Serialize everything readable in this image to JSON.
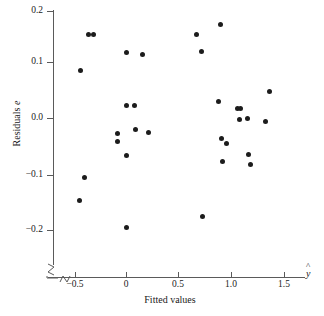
{
  "figure": {
    "background": "#ffffff",
    "point_color": "#1c1c1c",
    "axis_color": "#5a5a5a"
  },
  "axes": {
    "x": {
      "title": "Fitted values",
      "end_label": "y",
      "end_label_accent": "^",
      "ticks": [
        -0.5,
        0,
        0.5,
        1.0,
        1.5
      ],
      "tick_labels": [
        "−0.5",
        "0",
        "0.5",
        "1.0",
        "1.5"
      ],
      "has_break": true,
      "range": [
        -0.72,
        1.78
      ]
    },
    "y": {
      "title_text": "Residuals",
      "title_symbol": "e",
      "ticks": [
        0.2,
        0.1,
        0.0,
        -0.1,
        -0.2
      ],
      "tick_labels": [
        "0.2",
        "0.1",
        "0.0",
        "−0.1",
        "−0.2"
      ],
      "has_break": true,
      "range": [
        -0.26,
        0.2
      ]
    }
  },
  "chart_data": {
    "type": "scatter",
    "title": "",
    "xlabel": "Fitted values",
    "ylabel": "Residuals e",
    "xlim": [
      -0.72,
      1.78
    ],
    "ylim": [
      -0.26,
      0.2
    ],
    "grid": false,
    "legend": null,
    "series": [
      {
        "name": "residuals",
        "marker": "filled-circle",
        "color": "#1c1c1c",
        "points": [
          [
            -0.355,
            0.156
          ],
          [
            -0.305,
            0.156
          ],
          [
            -0.435,
            0.088
          ],
          [
            -0.085,
            -0.029
          ],
          [
            -0.08,
            -0.043
          ],
          [
            -0.395,
            -0.112
          ],
          [
            -0.445,
            -0.155
          ],
          [
            0.0,
            0.123
          ],
          [
            0.005,
            0.023
          ],
          [
            0.0,
            -0.07
          ],
          [
            0.0,
            -0.205
          ],
          [
            0.085,
            0.024
          ],
          [
            0.09,
            -0.022
          ],
          [
            0.16,
            0.119
          ],
          [
            0.215,
            -0.027
          ],
          [
            0.665,
            0.157
          ],
          [
            0.715,
            0.124
          ],
          [
            0.73,
            -0.184
          ],
          [
            0.895,
            0.175
          ],
          [
            0.88,
            0.03
          ],
          [
            0.91,
            -0.038
          ],
          [
            0.92,
            -0.082
          ],
          [
            0.955,
            -0.048
          ],
          [
            1.055,
            0.018
          ],
          [
            1.085,
            0.018
          ],
          [
            1.08,
            -0.003
          ],
          [
            1.15,
            -0.001
          ],
          [
            1.165,
            -0.068
          ],
          [
            1.18,
            -0.087
          ],
          [
            1.32,
            -0.007
          ],
          [
            1.36,
            0.05
          ]
        ]
      }
    ]
  }
}
